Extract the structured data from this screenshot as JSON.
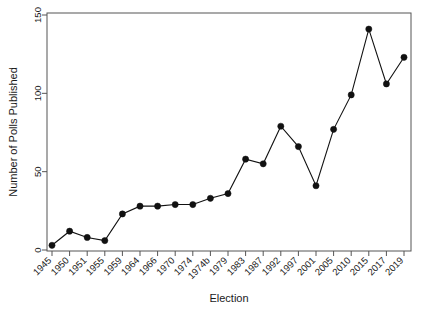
{
  "chart_data": {
    "type": "line",
    "title": "",
    "xlabel": "Election",
    "ylabel": "Number of Polls Published",
    "categories": [
      "1945",
      "1950",
      "1951",
      "1955",
      "1959",
      "1964",
      "1966",
      "1970",
      "1974",
      "1974b",
      "1979",
      "1983",
      "1987",
      "1992",
      "1997",
      "2001",
      "2005",
      "2010",
      "2015",
      "2017",
      "2019"
    ],
    "values": [
      3,
      12,
      8,
      6,
      23,
      28,
      28,
      29,
      29,
      33,
      36,
      58,
      55,
      79,
      66,
      41,
      77,
      99,
      141,
      106,
      123
    ],
    "series": [
      {
        "name": "Number of Polls Published",
        "values": [
          3,
          12,
          8,
          6,
          23,
          28,
          28,
          29,
          29,
          33,
          36,
          58,
          55,
          79,
          66,
          41,
          77,
          99,
          141,
          106,
          123
        ]
      }
    ],
    "ylim": [
      0,
      150
    ],
    "yticks": [
      0,
      50,
      100,
      150
    ],
    "ytick_labels": [
      "0",
      "50",
      "100",
      "150"
    ],
    "grid": false,
    "legend": false,
    "marker": "filled-circle",
    "line_color": "#111111",
    "marker_color": "#111111",
    "axis_color": "#555555",
    "background": "#ffffff",
    "xtick_label_rotation": 45
  }
}
